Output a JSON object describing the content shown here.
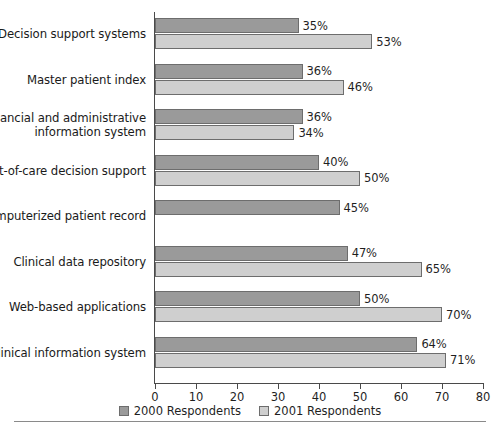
{
  "chart_data": {
    "type": "bar",
    "orientation": "horizontal",
    "title": "",
    "xlabel": "",
    "ylabel": "",
    "xlim": [
      0,
      80
    ],
    "xticks": [
      0,
      10,
      20,
      30,
      40,
      50,
      60,
      70,
      80
    ],
    "grid": false,
    "legend_position": "bottom",
    "categories": [
      "Decision support systems",
      "Master patient index",
      "Financial and administrative information system",
      "Point-of-care decision support",
      "Computerized patient record",
      "Clinical data repository",
      "Web-based applications",
      "Clinical information system"
    ],
    "series": [
      {
        "name": "2000 Respondents",
        "color": "#9a9a9a",
        "values": [
          35,
          36,
          36,
          40,
          45,
          47,
          50,
          64
        ],
        "labels": [
          "35%",
          "36%",
          "36%",
          "40%",
          "45%",
          "47%",
          "50%",
          "64%"
        ]
      },
      {
        "name": "2001 Respondents",
        "color": "#cfcfcf",
        "values": [
          53,
          46,
          34,
          50,
          null,
          65,
          70,
          71
        ],
        "labels": [
          "53%",
          "46%",
          "34%",
          "50%",
          "",
          "65%",
          "70%",
          "71%"
        ]
      }
    ]
  },
  "categories_display": [
    {
      "line1": "Decision support systems",
      "line2": ""
    },
    {
      "line1": "Master patient index",
      "line2": ""
    },
    {
      "line1": "Financial and administrative",
      "line2": "information system"
    },
    {
      "line1": "Point-of-care decision support",
      "line2": ""
    },
    {
      "line1": "Computerized patient record",
      "line2": ""
    },
    {
      "line1": "Clinical data repository",
      "line2": ""
    },
    {
      "line1": "Web-based applications",
      "line2": ""
    },
    {
      "line1": "Clinical information system",
      "line2": ""
    }
  ],
  "axis": {
    "tick_labels": [
      "0",
      "10",
      "20",
      "30",
      "40",
      "50",
      "60",
      "70",
      "80"
    ]
  },
  "legend": {
    "items": [
      {
        "label": "2000 Respondents",
        "color": "#9a9a9a"
      },
      {
        "label": "2001 Respondents",
        "color": "#cfcfcf"
      }
    ]
  }
}
